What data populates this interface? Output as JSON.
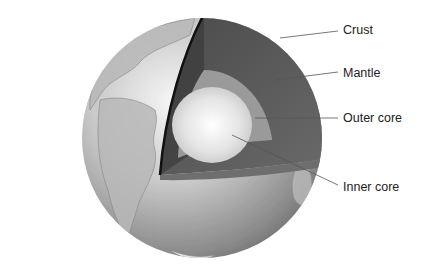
{
  "diagram": {
    "labels": [
      {
        "id": "crust",
        "text": "Crust",
        "x": 343,
        "y": 23
      },
      {
        "id": "mantle",
        "text": "Mantle",
        "x": 343,
        "y": 66
      },
      {
        "id": "outer_core",
        "text": "Outer core",
        "x": 343,
        "y": 111
      },
      {
        "id": "inner_core",
        "text": "Inner core",
        "x": 343,
        "y": 180
      }
    ],
    "colors": {
      "background": "#ffffff",
      "text": "#222222",
      "leader_line": "#555555"
    }
  }
}
